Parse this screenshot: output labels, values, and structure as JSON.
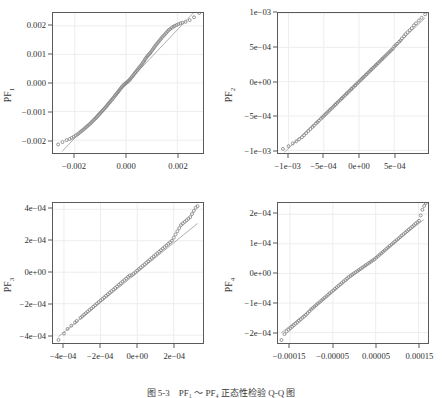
{
  "figure": {
    "caption": "图 5-3　PF₁ ～ PF₄ 正态性检验 Q-Q 图",
    "colors": {
      "point": "#8a8a8a",
      "line": "#9a9a9a",
      "grid": "#ededed",
      "axis": "#5a5a5a",
      "text": "#2e2e2e",
      "background": "#ffffff"
    }
  },
  "chart_data": [
    {
      "type": "scatter",
      "title": "",
      "panel_id": "PF1",
      "ylabel": "PF₁",
      "xlabel": "",
      "grid": true,
      "legend": "none",
      "xlim": [
        -0.00285,
        0.003
      ],
      "ylim": [
        -0.00245,
        0.00245
      ],
      "xticks": [
        -0.002,
        0.0,
        0.002
      ],
      "xticklabels": [
        "−0.002",
        "0.000",
        "0.002"
      ],
      "yticks": [
        -0.002,
        -0.001,
        0.0,
        0.001,
        0.002
      ],
      "yticklabels": [
        "−0.002",
        "−0.001",
        "0.000",
        "0.001",
        "0.002"
      ],
      "reference_line": {
        "x": [
          -0.0025,
          0.00262
        ],
        "y": [
          -0.0024,
          0.00245
        ]
      },
      "x": [
        -0.00265,
        -0.00248,
        -0.00232,
        -0.0022,
        -0.00212,
        -0.00204,
        -0.00197,
        -0.0019,
        -0.00184,
        -0.00178,
        -0.00172,
        -0.00166,
        -0.00161,
        -0.00156,
        -0.00151,
        -0.00146,
        -0.00141,
        -0.00136,
        -0.00132,
        -0.00127,
        -0.00123,
        -0.00118,
        -0.00114,
        -0.0011,
        -0.00106,
        -0.00102,
        -0.00098,
        -0.00094,
        -0.0009,
        -0.00086,
        -0.00082,
        -0.00078,
        -0.00074,
        -0.00071,
        -0.00067,
        -0.00063,
        -0.0006,
        -0.00056,
        -0.00052,
        -0.00049,
        -0.00045,
        -0.00042,
        -0.00038,
        -0.00035,
        -0.00031,
        -0.00028,
        -0.00024,
        -0.00021,
        -0.00017,
        -0.00014,
        -0.0001,
        -7e-05,
        -3e-05,
        0.0,
        3e-05,
        7e-05,
        0.0001,
        0.00014,
        0.00017,
        0.00021,
        0.00024,
        0.00028,
        0.00031,
        0.00035,
        0.00038,
        0.00042,
        0.00045,
        0.00049,
        0.00052,
        0.00056,
        0.0006,
        0.00063,
        0.00067,
        0.00071,
        0.00074,
        0.00078,
        0.00082,
        0.00086,
        0.0009,
        0.00094,
        0.00098,
        0.00102,
        0.00106,
        0.0011,
        0.00114,
        0.00118,
        0.00123,
        0.00127,
        0.00132,
        0.00136,
        0.00141,
        0.00146,
        0.00151,
        0.00156,
        0.00161,
        0.00166,
        0.00172,
        0.00178,
        0.00184,
        0.0019,
        0.00197,
        0.00204,
        0.00212,
        0.0022,
        0.00232,
        0.00248,
        0.00265,
        0.00285
      ],
      "y": [
        -0.00215,
        -0.00207,
        -0.002,
        -0.00196,
        -0.00192,
        -0.00188,
        -0.00184,
        -0.0018,
        -0.00176,
        -0.00171,
        -0.00167,
        -0.00163,
        -0.00159,
        -0.00155,
        -0.00151,
        -0.00147,
        -0.00143,
        -0.00139,
        -0.00135,
        -0.00131,
        -0.00127,
        -0.00123,
        -0.00119,
        -0.00115,
        -0.00111,
        -0.00107,
        -0.00103,
        -0.00099,
        -0.00095,
        -0.00091,
        -0.00087,
        -0.00083,
        -0.00079,
        -0.00075,
        -0.00071,
        -0.00067,
        -0.00063,
        -0.00059,
        -0.00055,
        -0.00051,
        -0.00047,
        -0.00043,
        -0.00039,
        -0.00035,
        -0.00031,
        -0.00027,
        -0.00023,
        -0.00019,
        -0.00015,
        -0.00011,
        -8e-05,
        -5e-05,
        -2e-05,
        0.0,
        2e-05,
        5e-05,
        8e-05,
        0.00011,
        0.00015,
        0.00019,
        0.00023,
        0.00027,
        0.00031,
        0.00035,
        0.00039,
        0.00043,
        0.00047,
        0.00051,
        0.00055,
        0.00059,
        0.00063,
        0.00068,
        0.00073,
        0.00078,
        0.00083,
        0.00088,
        0.00093,
        0.00097,
        0.00101,
        0.00105,
        0.0011,
        0.00115,
        0.0012,
        0.00125,
        0.0013,
        0.00135,
        0.0014,
        0.00145,
        0.0015,
        0.00155,
        0.0016,
        0.00165,
        0.0017,
        0.00175,
        0.0018,
        0.00185,
        0.00189,
        0.00193,
        0.00197,
        0.002,
        0.00203,
        0.00206,
        0.00209,
        0.00211,
        0.00214,
        0.0022,
        0.0023
      ]
    },
    {
      "type": "scatter",
      "title": "",
      "panel_id": "PF2",
      "ylabel": "PF₂",
      "xlabel": "",
      "grid": true,
      "legend": "none",
      "xlim": [
        -0.00115,
        0.00098
      ],
      "ylim": [
        -0.00104,
        0.001
      ],
      "xticks": [
        -0.001,
        -0.0005,
        0.0,
        0.0005
      ],
      "xticklabels": [
        "−1e−03",
        "−5e−04",
        "0e+00",
        "5e−04"
      ],
      "yticks": [
        -0.001,
        -0.0005,
        0.0,
        0.0005,
        0.001
      ],
      "yticklabels": [
        "−1e−03",
        "−5e−04",
        "0e+00",
        "5e−04",
        "1e−03"
      ],
      "reference_line": {
        "x": [
          -0.00106,
          0.00094
        ],
        "y": [
          -0.00103,
          0.00093
        ]
      },
      "x": [
        -0.00108,
        -0.001,
        -0.00094,
        -0.00089,
        -0.00085,
        -0.00081,
        -0.00078,
        -0.00075,
        -0.00072,
        -0.00069,
        -0.00066,
        -0.00064,
        -0.00061,
        -0.00059,
        -0.00057,
        -0.00054,
        -0.00052,
        -0.0005,
        -0.00048,
        -0.00046,
        -0.00044,
        -0.00042,
        -0.0004,
        -0.00038,
        -0.00036,
        -0.00034,
        -0.00033,
        -0.00031,
        -0.00029,
        -0.00027,
        -0.00025,
        -0.00024,
        -0.00022,
        -0.0002,
        -0.00018,
        -0.00017,
        -0.00015,
        -0.00013,
        -0.00011,
        -0.0001,
        -8e-05,
        -6e-05,
        -5e-05,
        -3e-05,
        -1e-05,
        1e-05,
        3e-05,
        5e-05,
        6e-05,
        8e-05,
        0.0001,
        0.00011,
        0.00013,
        0.00015,
        0.00017,
        0.00018,
        0.0002,
        0.00022,
        0.00024,
        0.00025,
        0.00027,
        0.00029,
        0.00031,
        0.00033,
        0.00034,
        0.00036,
        0.00038,
        0.0004,
        0.00042,
        0.00044,
        0.00046,
        0.00048,
        0.0005,
        0.00052,
        0.00054,
        0.00057,
        0.00059,
        0.00061,
        0.00064,
        0.00066,
        0.00069,
        0.00072,
        0.00075,
        0.00078,
        0.00081,
        0.00085,
        0.00089,
        0.00094
      ],
      "y": [
        -0.00098,
        -0.00094,
        -0.0009,
        -0.00087,
        -0.00084,
        -0.00081,
        -0.00078,
        -0.00075,
        -0.00072,
        -0.00069,
        -0.00066,
        -0.00064,
        -0.00061,
        -0.00059,
        -0.00057,
        -0.00054,
        -0.00052,
        -0.0005,
        -0.00048,
        -0.00046,
        -0.00044,
        -0.00042,
        -0.0004,
        -0.00038,
        -0.00036,
        -0.00034,
        -0.00033,
        -0.00031,
        -0.00029,
        -0.00027,
        -0.00025,
        -0.00024,
        -0.00022,
        -0.0002,
        -0.00018,
        -0.00017,
        -0.00015,
        -0.00013,
        -0.00011,
        -0.0001,
        -8e-05,
        -6e-05,
        -5e-05,
        -3e-05,
        -1e-05,
        1e-05,
        3e-05,
        5e-05,
        6e-05,
        8e-05,
        0.0001,
        0.00011,
        0.00013,
        0.00015,
        0.00017,
        0.00018,
        0.0002,
        0.00022,
        0.00024,
        0.00025,
        0.00027,
        0.00029,
        0.00031,
        0.00033,
        0.00034,
        0.00036,
        0.00038,
        0.0004,
        0.00042,
        0.00044,
        0.00046,
        0.00048,
        0.00051,
        0.00053,
        0.00055,
        0.00058,
        0.0006,
        0.00063,
        0.00066,
        0.00069,
        0.00072,
        0.00075,
        0.00078,
        0.00082,
        0.00085,
        0.00089,
        0.00093,
        0.00098
      ]
    },
    {
      "type": "scatter",
      "title": "",
      "panel_id": "PF3",
      "ylabel": "PF₃",
      "xlabel": "",
      "grid": true,
      "legend": "none",
      "xlim": [
        -0.00046,
        0.00036
      ],
      "ylim": [
        -0.00045,
        0.00044
      ],
      "xticks": [
        -0.0004,
        -0.0002,
        0.0,
        0.0002
      ],
      "xticklabels": [
        "−4e−04",
        "−2e−04",
        "0e+00",
        "2e−04"
      ],
      "yticks": [
        -0.0004,
        -0.0002,
        0.0,
        0.0002,
        0.0004
      ],
      "yticklabels": [
        "−4e−04",
        "−2e−04",
        "0e+00",
        "2e−04",
        "4e−04"
      ],
      "reference_line": {
        "x": [
          -0.00043,
          0.00033
        ],
        "y": [
          -0.00041,
          0.00031
        ]
      },
      "x": [
        -0.00043,
        -0.0004,
        -0.00038,
        -0.00036,
        -0.00034,
        -0.00033,
        -0.00031,
        -0.0003,
        -0.00029,
        -0.00028,
        -0.00027,
        -0.00026,
        -0.00025,
        -0.00024,
        -0.00023,
        -0.00022,
        -0.00021,
        -0.0002,
        -0.00019,
        -0.00018,
        -0.00017,
        -0.00016,
        -0.00015,
        -0.00014,
        -0.00013,
        -0.00012,
        -0.00011,
        -0.0001,
        -9e-05,
        -8e-05,
        -7e-05,
        -6e-05,
        -5e-05,
        -4e-05,
        -3e-05,
        -2e-05,
        -1e-05,
        0.0,
        1e-05,
        2e-05,
        3e-05,
        4e-05,
        5e-05,
        6e-05,
        7e-05,
        8e-05,
        9e-05,
        0.0001,
        0.00011,
        0.00012,
        0.00013,
        0.00014,
        0.00015,
        0.00016,
        0.00017,
        0.00018,
        0.00019,
        0.0002,
        0.00021,
        0.00022,
        0.00023,
        0.00024,
        0.00025,
        0.00026,
        0.00027,
        0.00028,
        0.00029,
        0.0003,
        0.00031,
        0.00032,
        0.00033
      ],
      "y": [
        -0.00043,
        -0.00039,
        -0.00036,
        -0.00034,
        -0.00032,
        -0.00031,
        -0.00029,
        -0.00028,
        -0.00027,
        -0.00026,
        -0.00025,
        -0.00024,
        -0.00023,
        -0.00022,
        -0.00021,
        -0.0002,
        -0.00019,
        -0.00018,
        -0.00017,
        -0.00016,
        -0.00015,
        -0.00014,
        -0.00013,
        -0.00012,
        -0.00011,
        -0.0001,
        -9e-05,
        -8e-05,
        -7e-05,
        -6e-05,
        -5e-05,
        -4e-05,
        -3e-05,
        -2e-05,
        -2e-05,
        -1e-05,
        0.0,
        1e-05,
        2e-05,
        3e-05,
        4e-05,
        5e-05,
        6e-05,
        7e-05,
        8e-05,
        9e-05,
        0.0001,
        0.00011,
        0.00012,
        0.00013,
        0.00014,
        0.00015,
        0.00016,
        0.00017,
        0.00018,
        0.00019,
        0.0002,
        0.00022,
        0.00024,
        0.00026,
        0.00028,
        0.0003,
        0.00031,
        0.00032,
        0.00033,
        0.00034,
        0.00035,
        0.00037,
        0.00039,
        0.00041,
        0.00042
      ]
    },
    {
      "type": "scatter",
      "title": "",
      "panel_id": "PF4",
      "ylabel": "PF₄",
      "xlabel": "",
      "grid": true,
      "legend": "none",
      "xlim": [
        -0.000178,
        0.000172
      ],
      "ylim": [
        -0.000235,
        0.000238
      ],
      "xticks": [
        -0.00015,
        -5e-05,
        5e-05,
        0.00015
      ],
      "xticklabels": [
        "−0.00015",
        "−0.00005",
        "0.00005",
        "0.00015"
      ],
      "yticks": [
        -0.0002,
        -0.0001,
        0.0,
        0.0001,
        0.0002
      ],
      "yticklabels": [
        "−2e−04",
        "−1e−04",
        "0e+00",
        "1e−04",
        "2e−04"
      ],
      "reference_line": {
        "x": [
          -0.00017,
          0.000162
        ],
        "y": [
          -0.0002,
          0.000182
        ]
      },
      "x": [
        -0.00017,
        -0.000163,
        -0.000158,
        -0.000153,
        -0.000149,
        -0.000145,
        -0.000141,
        -0.000137,
        -0.000133,
        -0.000129,
        -0.000125,
        -0.000121,
        -0.000117,
        -0.000113,
        -0.000109,
        -0.000105,
        -0.000101,
        -9.7e-05,
        -9.3e-05,
        -8.9e-05,
        -8.5e-05,
        -8.1e-05,
        -7.7e-05,
        -7.3e-05,
        -6.9e-05,
        -6.5e-05,
        -6.1e-05,
        -5.7e-05,
        -5.3e-05,
        -4.9e-05,
        -4.5e-05,
        -4.1e-05,
        -3.7e-05,
        -3.3e-05,
        -2.9e-05,
        -2.5e-05,
        -2.1e-05,
        -1.7e-05,
        -1.3e-05,
        -9e-06,
        -5e-06,
        -1e-06,
        3e-06,
        7e-06,
        1.1e-05,
        1.5e-05,
        1.9e-05,
        2.3e-05,
        2.7e-05,
        3.1e-05,
        3.5e-05,
        3.9e-05,
        4.3e-05,
        4.7e-05,
        5.1e-05,
        5.5e-05,
        5.9e-05,
        6.3e-05,
        6.7e-05,
        7.1e-05,
        7.5e-05,
        7.9e-05,
        8.3e-05,
        8.7e-05,
        9.1e-05,
        9.5e-05,
        9.9e-05,
        0.000103,
        0.000107,
        0.000111,
        0.000115,
        0.000119,
        0.000123,
        0.000127,
        0.000131,
        0.000135,
        0.000139,
        0.000143,
        0.000147,
        0.000151,
        0.000155,
        0.000159,
        0.000163,
        0.000167
      ],
      "y": [
        -0.000225,
        -0.000205,
        -0.000196,
        -0.00019,
        -0.000185,
        -0.00018,
        -0.000175,
        -0.00017,
        -0.000165,
        -0.00016,
        -0.000155,
        -0.00015,
        -0.000145,
        -0.00014,
        -0.000134,
        -0.000128,
        -0.000122,
        -0.000117,
        -0.000112,
        -0.000107,
        -0.000102,
        -9.7e-05,
        -9.2e-05,
        -8.7e-05,
        -8.2e-05,
        -7.7e-05,
        -7.2e-05,
        -6.7e-05,
        -6.2e-05,
        -5.7e-05,
        -5.2e-05,
        -4.7e-05,
        -4.2e-05,
        -3.7e-05,
        -3.2e-05,
        -2.7e-05,
        -2.2e-05,
        -1.7e-05,
        -1.2e-05,
        -8e-06,
        -4e-06,
        0.0,
        4e-06,
        8e-06,
        1.2e-05,
        1.6e-05,
        2e-05,
        2.4e-05,
        2.8e-05,
        3.2e-05,
        3.6e-05,
        4e-05,
        4.4e-05,
        4.8e-05,
        5.3e-05,
        5.8e-05,
        6.3e-05,
        6.8e-05,
        7.3e-05,
        7.8e-05,
        8.3e-05,
        8.8e-05,
        9.3e-05,
        9.8e-05,
        0.000103,
        0.000108,
        0.000113,
        0.000118,
        0.000123,
        0.000128,
        0.000133,
        0.000138,
        0.000143,
        0.000148,
        0.000153,
        0.000158,
        0.000163,
        0.000168,
        0.000173,
        0.000178,
        0.000196,
        0.000215,
        0.000228
      ]
    }
  ]
}
